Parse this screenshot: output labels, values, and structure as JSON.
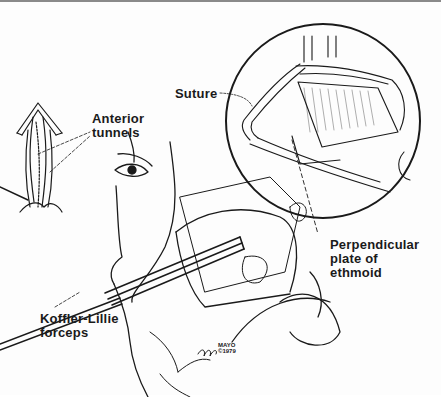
{
  "figure": {
    "type": "anatomical-illustration",
    "labels": {
      "anterior_tunnels_line1": "Anterior",
      "anterior_tunnels_line2": "tunnels",
      "suture": "Suture",
      "perpendicular_line1": "Perpendicular",
      "perpendicular_line2": "plate of",
      "perpendicular_line3": "ethmoid",
      "forceps_line1": "Koffler-Lillie",
      "forceps_line2": "forceps"
    },
    "credit": {
      "org": "MAYO",
      "copyright": "©1979"
    },
    "colors": {
      "ink": "#1a1a1a",
      "paper": "#fdfdfd",
      "border": "#8a8a8a"
    }
  }
}
